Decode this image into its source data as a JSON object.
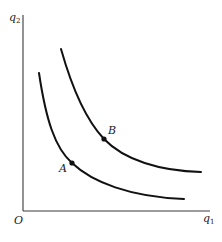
{
  "diagram": {
    "type": "indifference-curves",
    "axes": {
      "x_label": "q",
      "x_subscript": "1",
      "y_label": "q",
      "y_subscript": "2",
      "origin_label": "O"
    },
    "curves": [
      {
        "name": "lower-curve",
        "point_label": "A"
      },
      {
        "name": "upper-curve",
        "point_label": "B"
      }
    ],
    "colors": {
      "ink": "#111111",
      "axis": "#3a3a3a",
      "background": "#ffffff"
    }
  }
}
